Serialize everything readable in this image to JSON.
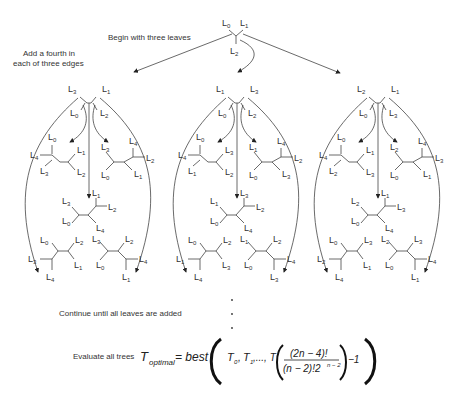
{
  "annotations": {
    "begin": "Begin with three leaves",
    "add_fourth_line1": "Add a fourth in",
    "add_fourth_line2": "each of three edges",
    "continue": "Continue until all leaves are added",
    "evaluate": "Evaluate all trees"
  },
  "formula": {
    "lhs_T": "T",
    "lhs_sub": "optimal",
    "equals": "= best",
    "args_T0": "T",
    "args_T0_sub": "0",
    "args_sep1": ", ",
    "args_T1": "T",
    "args_T1_sub": "1",
    "args_ellipsis": ",..., T",
    "numerator": "(2n − 4)!",
    "denominator": "(n − 2)!2",
    "denominator_exp": "n − 2",
    "minus_one": "−1"
  },
  "trees": {
    "root": {
      "leaves": [
        "L0",
        "L1",
        "L2"
      ]
    },
    "level2": [
      {
        "leaves": [
          "L3",
          "L1",
          "L0",
          "L2"
        ]
      },
      {
        "leaves": [
          "L1",
          "L3",
          "L0",
          "L2"
        ]
      },
      {
        "leaves": [
          "L2",
          "L1",
          "L0",
          "L3"
        ]
      }
    ],
    "level3": [
      [
        {
          "top_left": "L0",
          "left": "L4",
          "bottom_left": "L3",
          "top_right": "L1",
          "bottom_right": "L2"
        },
        {
          "top_left": "L3",
          "bottom_left": "L0",
          "top_right": "L4",
          "right": "L2",
          "bottom_right": "L1"
        },
        {
          "top_left": "L3",
          "bottom_left": "L0",
          "top_right": "L1",
          "right": "L2",
          "bottom_right": "L4"
        },
        {
          "top_left": "L0",
          "left": "L3",
          "bottom": "L4",
          "top_right": "L2",
          "bottom_right": "L1"
        },
        {
          "top_left": "L3",
          "bottom_left": "L0",
          "top_right": "L2",
          "right": "L4",
          "bottom": "L1"
        }
      ],
      [
        {
          "top_left": "L0",
          "left": "L4",
          "bottom_left": "L1",
          "top_right": "L3",
          "bottom_right": "L2"
        },
        {
          "top_left": "L1",
          "bottom_left": "L0",
          "top_right": "L4",
          "right": "L2",
          "bottom_right": "L3"
        },
        {
          "top_left": "L1",
          "bottom_left": "L0",
          "top_right": "L3",
          "right": "L2",
          "bottom_right": "L4"
        },
        {
          "top_left": "L0",
          "left": "L1",
          "bottom": "L4",
          "top_right": "L2",
          "bottom_right": "L3"
        },
        {
          "top_left": "L1",
          "bottom_left": "L0",
          "top_right": "L2",
          "right": "L4",
          "bottom": "L3"
        }
      ],
      [
        {
          "top_left": "L0",
          "left": "L4",
          "bottom_left": "L2",
          "top_right": "L1",
          "bottom_right": "L3"
        },
        {
          "top_left": "L2",
          "bottom_left": "L0",
          "top_right": "L4",
          "right": "L3",
          "bottom_right": "L1"
        },
        {
          "top_left": "L2",
          "bottom_left": "L0",
          "top_right": "L1",
          "right": "L3",
          "bottom_right": "L4"
        },
        {
          "top_left": "L0",
          "left": "L2",
          "bottom": "L4",
          "top_right": "L3",
          "bottom_right": "L1"
        },
        {
          "top_left": "L2",
          "bottom_left": "L0",
          "top_right": "L3",
          "right": "L4",
          "bottom": "L1"
        }
      ]
    ]
  },
  "ellipsis_dots": 3
}
